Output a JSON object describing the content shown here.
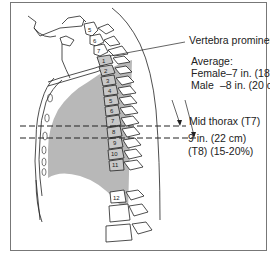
{
  "labels": {
    "c7": "Vertebra prominens (C7)",
    "average_title": "Average:",
    "female": "Female–7 in. (18 cm)",
    "male_label": "Male",
    "male_value": "–8 in. (20 cm)",
    "mid_thorax": "Mid thorax (T7)",
    "depth": "9 in. (22 cm)",
    "t8": "(T8) (15-20%)"
  },
  "vertebrae": {
    "cervical": [
      "5",
      "6",
      "7"
    ],
    "thoracic": [
      "1",
      "2",
      "3",
      "4",
      "5",
      "6",
      "7",
      "8",
      "9",
      "10",
      "11",
      "12"
    ]
  },
  "colors": {
    "lung_fill": "#b8b8b8",
    "line": "#222222",
    "frame": "#777777"
  }
}
